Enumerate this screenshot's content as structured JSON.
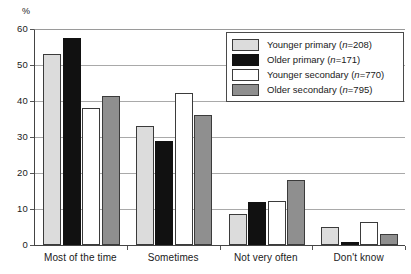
{
  "chart_data": {
    "type": "bar",
    "title": "",
    "xlabel": "",
    "ylabel": "%",
    "ylim": [
      0,
      60
    ],
    "yticks": [
      0,
      10,
      20,
      30,
      40,
      50,
      60
    ],
    "ytick_labels": [
      "0",
      "10",
      "20",
      "30",
      "40",
      "50",
      "60"
    ],
    "grid": true,
    "legend_position": "upper-right-inside",
    "categories": [
      "Most of the time",
      "Sometimes",
      "Not very often",
      "Don't know"
    ],
    "series": [
      {
        "name": "Younger primary (n=208)",
        "label_main": "Younger primary (",
        "label_italic": "n",
        "label_tail": "=208)",
        "color": "#dcdcdc",
        "values": [
          53,
          33,
          8.5,
          5
        ]
      },
      {
        "name": "Older primary (n=171)",
        "label_main": "Older primary (",
        "label_italic": "n",
        "label_tail": "=171)",
        "color": "#111111",
        "values": [
          57.5,
          29,
          12,
          0.7
        ]
      },
      {
        "name": "Younger secondary (n=770)",
        "label_main": "Younger secondary (",
        "label_italic": "n",
        "label_tail": "=770)",
        "color": "#ffffff",
        "values": [
          38,
          42.3,
          12.3,
          6.3
        ]
      },
      {
        "name": "Older secondary (n=795)",
        "label_main": "Older secondary (",
        "label_italic": "n",
        "label_tail": "=795)",
        "color": "#8f8f8f",
        "values": [
          41.5,
          36,
          18,
          3
        ]
      }
    ]
  }
}
